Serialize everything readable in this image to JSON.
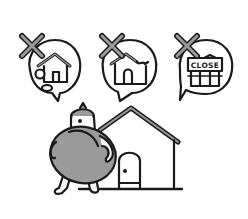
{
  "illustration": {
    "description": "Person standing next to a house, thinking of three crossed-out concerns",
    "colors": {
      "outline": "#1a1a1a",
      "gray_fill": "#9a9a9a",
      "background": "#ffffff"
    },
    "bubbles": [
      {
        "icon": "damaged-house-with-rocks-icon",
        "crossed_out": true
      },
      {
        "icon": "broken-roof-house-icon",
        "crossed_out": true
      },
      {
        "icon": "closed-shop-icon",
        "crossed_out": true,
        "sign_text": "CLOSE"
      }
    ],
    "scene": {
      "figure": "person-with-gray-round-body-icon",
      "house": "house-icon"
    }
  }
}
